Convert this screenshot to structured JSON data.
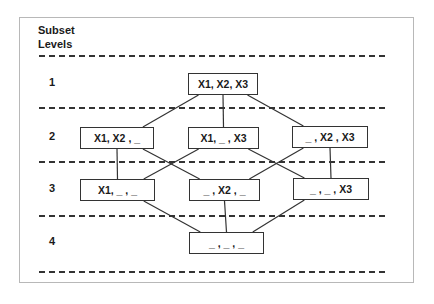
{
  "diagram": {
    "title_line1": "Subset",
    "title_line2": "Levels",
    "levels": [
      {
        "label": "1",
        "y": 83
      },
      {
        "label": "2",
        "y": 137
      },
      {
        "label": "3",
        "y": 189
      },
      {
        "label": "4",
        "y": 242
      }
    ],
    "dashed_lines_y": [
      56,
      108,
      162,
      216,
      272
    ],
    "nodes": [
      {
        "id": "n123",
        "text": "X1, X2, X3",
        "x": 188,
        "y": 73,
        "w": 70
      },
      {
        "id": "n12",
        "text": "X1, X2 , _",
        "x": 80,
        "y": 127,
        "w": 74
      },
      {
        "id": "n13",
        "text": "X1, _ , X3",
        "x": 188,
        "y": 127,
        "w": 71
      },
      {
        "id": "n23",
        "text": "_ , X2 , X3",
        "x": 292,
        "y": 126,
        "w": 76
      },
      {
        "id": "n1",
        "text": "X1, _ , _",
        "x": 80,
        "y": 179,
        "w": 75
      },
      {
        "id": "n2",
        "text": "_ , X2 , _",
        "x": 189,
        "y": 179,
        "w": 71
      },
      {
        "id": "n3",
        "text": "_ , _ , X3",
        "x": 293,
        "y": 178,
        "w": 76
      },
      {
        "id": "n0",
        "text": "_ , _ , _",
        "x": 189,
        "y": 232,
        "w": 75
      }
    ],
    "edges": [
      {
        "from": "n123",
        "to": "n12"
      },
      {
        "from": "n123",
        "to": "n13"
      },
      {
        "from": "n123",
        "to": "n23"
      },
      {
        "from": "n12",
        "to": "n1"
      },
      {
        "from": "n12",
        "to": "n2"
      },
      {
        "from": "n13",
        "to": "n1"
      },
      {
        "from": "n13",
        "to": "n3"
      },
      {
        "from": "n23",
        "to": "n2"
      },
      {
        "from": "n23",
        "to": "n3"
      },
      {
        "from": "n1",
        "to": "n0"
      },
      {
        "from": "n2",
        "to": "n0"
      },
      {
        "from": "n3",
        "to": "n0"
      }
    ]
  }
}
